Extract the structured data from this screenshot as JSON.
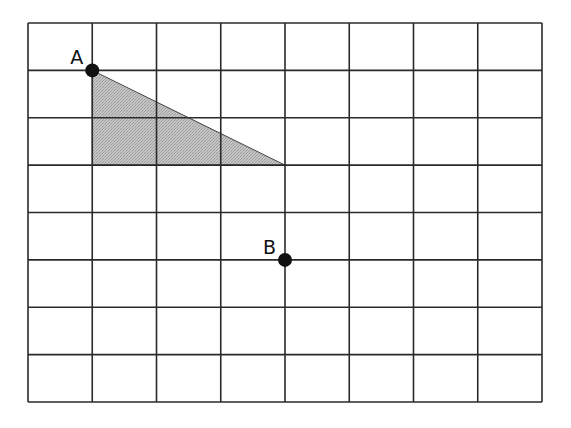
{
  "diagram": {
    "type": "coordinate-grid",
    "grid": {
      "columns": 8,
      "rows": 8,
      "left": 28,
      "top": 23,
      "right": 542,
      "bottom": 402,
      "line_color": "#2a2a2a"
    },
    "shaded_triangle": {
      "vertices_grid": [
        [
          1,
          1
        ],
        [
          1,
          3
        ],
        [
          4,
          3
        ]
      ],
      "fill_color": "#b9b9b9"
    },
    "points": [
      {
        "label": "A",
        "grid_x": 1,
        "grid_y": 1
      },
      {
        "label": "B",
        "grid_x": 4,
        "grid_y": 5
      }
    ]
  }
}
